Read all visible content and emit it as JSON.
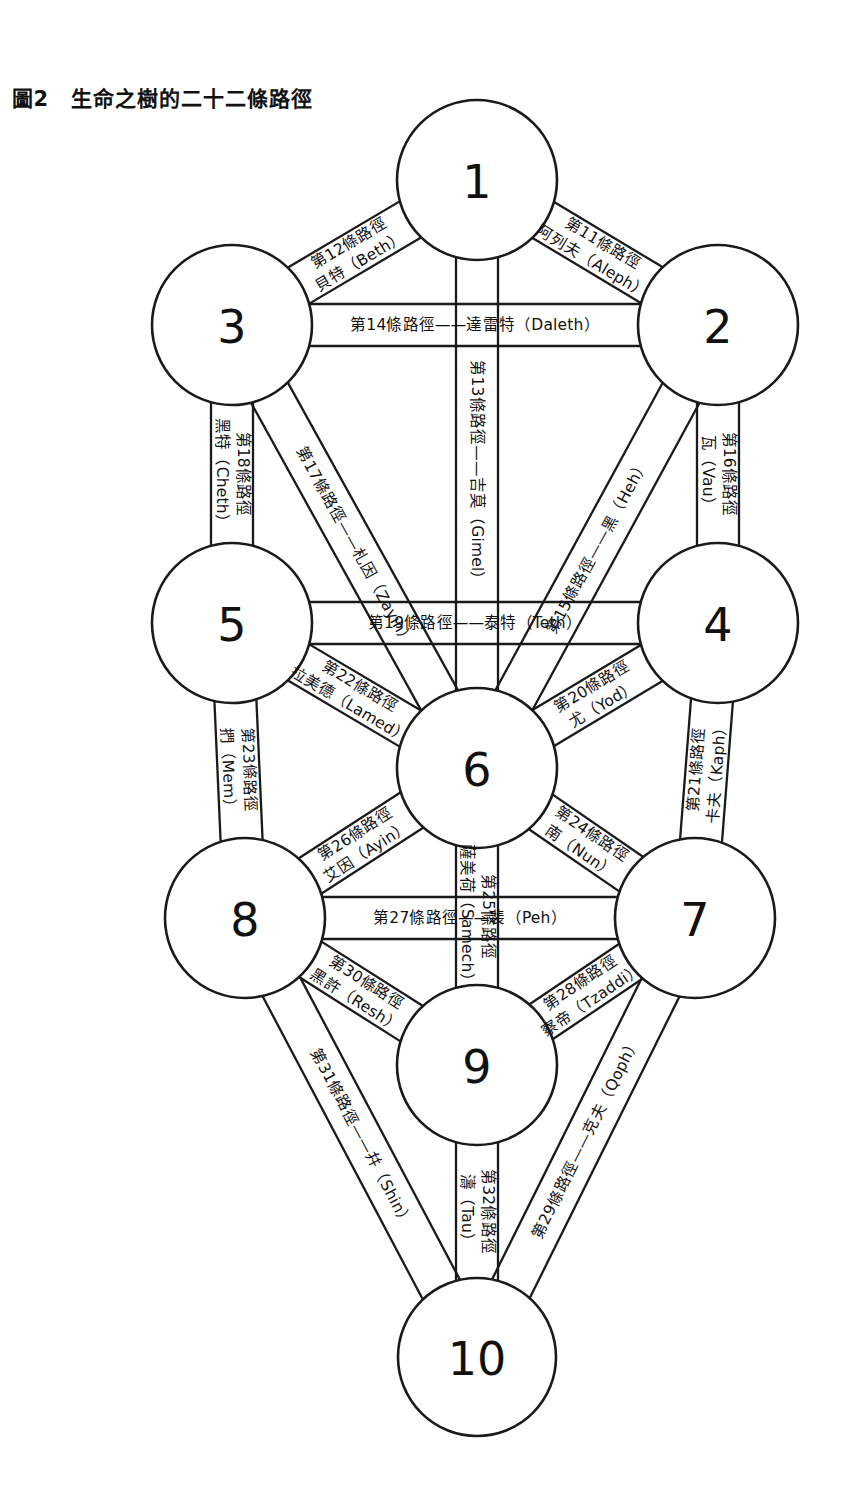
{
  "figure": {
    "tag": "圖2",
    "title": "生命之樹的二十二條路徑",
    "ink_color": "#1a1a1a",
    "background_color": "#ffffff"
  },
  "chart_data": {
    "type": "diagram",
    "title": "生命之樹的二十二條路徑",
    "nodes": [
      {
        "id": 1,
        "label": "1",
        "cx": 477,
        "cy": 180,
        "r": 80
      },
      {
        "id": 2,
        "label": "2",
        "cx": 718,
        "cy": 325,
        "r": 80
      },
      {
        "id": 3,
        "label": "3",
        "cx": 232,
        "cy": 325,
        "r": 80
      },
      {
        "id": 4,
        "label": "4",
        "cx": 718,
        "cy": 623,
        "r": 80
      },
      {
        "id": 5,
        "label": "5",
        "cx": 232,
        "cy": 623,
        "r": 80
      },
      {
        "id": 6,
        "label": "6",
        "cx": 477,
        "cy": 768,
        "r": 80
      },
      {
        "id": 7,
        "label": "7",
        "cx": 695,
        "cy": 918,
        "r": 80
      },
      {
        "id": 8,
        "label": "8",
        "cx": 245,
        "cy": 918,
        "r": 80
      },
      {
        "id": 9,
        "label": "9",
        "cx": 477,
        "cy": 1065,
        "r": 80
      },
      {
        "id": 10,
        "label": "10",
        "cx": 477,
        "cy": 1357,
        "r": 79
      }
    ],
    "paths": [
      {
        "n": 11,
        "from": 1,
        "to": 2,
        "line1": "第11條路徑",
        "line2": "阿列夫（Aleph）",
        "letter": "Aleph",
        "hebrew_cn": "阿列夫"
      },
      {
        "n": 12,
        "from": 1,
        "to": 3,
        "line1": "第12條路徑",
        "line2": "貝特（Beth）",
        "letter": "Beth",
        "hebrew_cn": "貝特"
      },
      {
        "n": 13,
        "from": 1,
        "to": 6,
        "line1": "第13條路徑——吉莫（Gimel）",
        "line2": "",
        "letter": "Gimel",
        "hebrew_cn": "吉莫"
      },
      {
        "n": 14,
        "from": 3,
        "to": 2,
        "line1": "第14條路徑——達雷特（Daleth）",
        "line2": "",
        "letter": "Daleth",
        "hebrew_cn": "達雷特"
      },
      {
        "n": 15,
        "from": 2,
        "to": 6,
        "line1": "第15條路徑——黑（Heh）",
        "line2": "",
        "letter": "Heh",
        "hebrew_cn": "黑"
      },
      {
        "n": 16,
        "from": 2,
        "to": 4,
        "line1": "第16條路徑",
        "line2": "瓦（Vau）",
        "letter": "Vau",
        "hebrew_cn": "瓦"
      },
      {
        "n": 17,
        "from": 3,
        "to": 6,
        "line1": "第17條路徑——札因（Zayin）",
        "line2": "",
        "letter": "Zayin",
        "hebrew_cn": "札因"
      },
      {
        "n": 18,
        "from": 3,
        "to": 5,
        "line1": "第18條路徑",
        "line2": "黑特（Cheth）",
        "letter": "Cheth",
        "hebrew_cn": "黑特"
      },
      {
        "n": 19,
        "from": 5,
        "to": 4,
        "line1": "第19條路徑——泰特（Teth）",
        "line2": "",
        "letter": "Teth",
        "hebrew_cn": "泰特"
      },
      {
        "n": 20,
        "from": 4,
        "to": 6,
        "line1": "第20條路徑",
        "line2": "尤（Yod）",
        "letter": "Yod",
        "hebrew_cn": "尤"
      },
      {
        "n": 21,
        "from": 4,
        "to": 7,
        "line1": "第21條路徑",
        "line2": "卡夫（Kaph）",
        "letter": "Kaph",
        "hebrew_cn": "卡夫"
      },
      {
        "n": 22,
        "from": 5,
        "to": 6,
        "line1": "第22條路徑",
        "line2": "拉美德（Lamed）",
        "letter": "Lamed",
        "hebrew_cn": "拉美德"
      },
      {
        "n": 23,
        "from": 5,
        "to": 8,
        "line1": "第23條路徑",
        "line2": "捫（Mem）",
        "letter": "Mem",
        "hebrew_cn": "捫"
      },
      {
        "n": 24,
        "from": 6,
        "to": 7,
        "line1": "第24條路徑",
        "line2": "南（Nun）",
        "letter": "Nun",
        "hebrew_cn": "南"
      },
      {
        "n": 25,
        "from": 6,
        "to": 9,
        "line1": "第25條路徑",
        "line2": "薩美荷（Samech）",
        "letter": "Samech",
        "hebrew_cn": "薩美荷"
      },
      {
        "n": 26,
        "from": 6,
        "to": 8,
        "line1": "第26條路徑",
        "line2": "艾因（Ayin）",
        "letter": "Ayin",
        "hebrew_cn": "艾因"
      },
      {
        "n": 27,
        "from": 8,
        "to": 7,
        "line1": "第27條路徑——裴（Peh）",
        "line2": "",
        "letter": "Peh",
        "hebrew_cn": "裴"
      },
      {
        "n": 28,
        "from": 7,
        "to": 9,
        "line1": "第28條路徑",
        "line2": "察帝（Tzaddi）",
        "letter": "Tzaddi",
        "hebrew_cn": "察帝"
      },
      {
        "n": 29,
        "from": 7,
        "to": 10,
        "line1": "第29條路徑——克夫（Qoph）",
        "line2": "",
        "letter": "Qoph",
        "hebrew_cn": "克夫"
      },
      {
        "n": 30,
        "from": 8,
        "to": 9,
        "line1": "第30條路徑",
        "line2": "黑許（Resh）",
        "letter": "Resh",
        "hebrew_cn": "黑許"
      },
      {
        "n": 31,
        "from": 8,
        "to": 10,
        "line1": "第31條路徑——幷（Shin）",
        "line2": "",
        "letter": "Shin",
        "hebrew_cn": "幷"
      },
      {
        "n": 32,
        "from": 9,
        "to": 10,
        "line1": "第32條路徑",
        "line2": "濤（Tau）",
        "letter": "Tau",
        "hebrew_cn": "濤"
      }
    ]
  }
}
